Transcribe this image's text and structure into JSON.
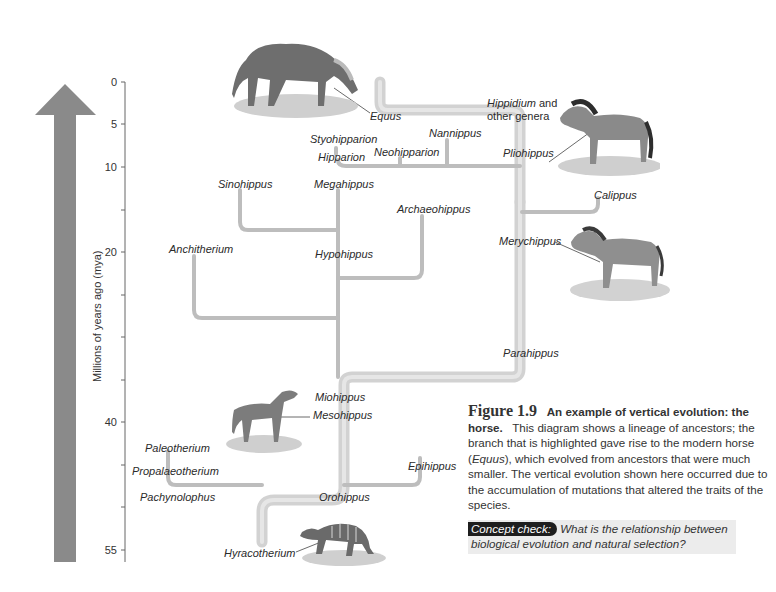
{
  "axis": {
    "label": "Millions of years ago (mya)",
    "ticks": [
      {
        "value": "0",
        "y": 82
      },
      {
        "value": "5",
        "y": 124
      },
      {
        "value": "10",
        "y": 167
      },
      {
        "value": "20",
        "y": 252
      },
      {
        "value": "40",
        "y": 422
      },
      {
        "value": "55",
        "y": 550
      }
    ],
    "minor_ticks_y": [
      210,
      295,
      337,
      380,
      465,
      507
    ]
  },
  "arrow": {
    "color": "#888888",
    "direction": "up"
  },
  "taxa": {
    "equus": "Equus",
    "hippidium": "Hippidium",
    "hippidium_suffix": " and",
    "other_genera": "other genera",
    "nannippus": "Nannippus",
    "styohipparion": "Styohipparion",
    "hipparion": "Hipparion",
    "neohipparion": "Neohipparion",
    "pliohippus": "Pliohippus",
    "calippus": "Calippus",
    "sinohippus": "Sinohippus",
    "megahippus": "Megahippus",
    "archaeohippus": "Archaeohippus",
    "anchitherium": "Anchitherium",
    "hypohippus": "Hypohippus",
    "merychippus": "Merychippus",
    "parahippus": "Parahippus",
    "miohippus": "Miohippus",
    "mesohippus": "Mesohippus",
    "paleotherium": "Paleotherium",
    "propalaeotherium": "Propalaeotherium",
    "pachynolophus": "Pachynolophus",
    "epihippus": "Epihippus",
    "orohippus": "Orohippus",
    "hyracotherium": "Hyracotherium"
  },
  "caption": {
    "figure_number": "Figure 1.9",
    "title": "An example of vertical evolution: the horse.",
    "body_1": "This diagram shows a lineage of ancestors; the branch that is highlighted gave rise to the modern horse (",
    "body_italic": "Equus",
    "body_2": "), which evolved from ancestors that were much smaller. The vertical evolution shown here occurred due to the accumulation of mutations that altered the traits of the species."
  },
  "concept_check": {
    "tag": "Concept check:",
    "question": "What is the relationship between biological evolution and natural selection?"
  },
  "colors": {
    "branch": "#c4c4c4",
    "highlight": "#d6d6d6",
    "arrow": "#888888",
    "axis": "#555555",
    "concept_tag_bg": "#1e1e1e",
    "concept_bg": "#ececec"
  }
}
